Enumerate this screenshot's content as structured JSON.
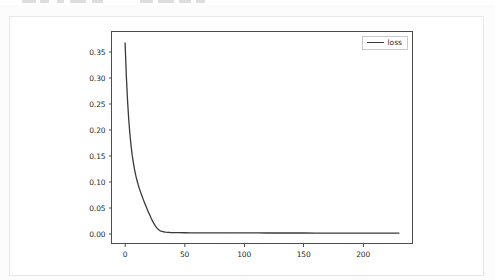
{
  "toolbar": {
    "visible_sliver": true,
    "items": [
      {
        "name": "toolbar-chip-1",
        "x": 22,
        "w": 14
      },
      {
        "name": "toolbar-chip-2",
        "x": 40,
        "w": 9
      },
      {
        "name": "toolbar-chip-3",
        "x": 57,
        "w": 7
      },
      {
        "name": "toolbar-chip-4",
        "x": 70,
        "w": 16
      },
      {
        "name": "toolbar-chip-5",
        "x": 92,
        "w": 11
      },
      {
        "name": "toolbar-chip-6",
        "x": 140,
        "w": 13
      },
      {
        "name": "toolbar-chip-7",
        "x": 158,
        "w": 16
      },
      {
        "name": "toolbar-chip-8",
        "x": 179,
        "w": 12
      },
      {
        "name": "toolbar-chip-9",
        "x": 196,
        "w": 9
      }
    ]
  },
  "card": {
    "background": "#ffffff",
    "border_color": "#e9e9ea"
  },
  "chart_data": {
    "type": "line",
    "title": "",
    "xlabel": "",
    "ylabel": "",
    "xlim": [
      -11,
      241
    ],
    "ylim": [
      -0.018,
      0.389
    ],
    "grid": false,
    "legend": {
      "position": "upper right",
      "entries": [
        "loss"
      ]
    },
    "xticks": [
      0,
      50,
      100,
      150,
      200
    ],
    "xticklabels": [
      "0",
      "50",
      "100",
      "150",
      "200"
    ],
    "yticks": [
      0.0,
      0.05,
      0.1,
      0.15,
      0.2,
      0.25,
      0.3,
      0.35
    ],
    "yticklabels": [
      "0.00",
      "0.05",
      "0.10",
      "0.15",
      "0.20",
      "0.25",
      "0.30",
      "0.35"
    ],
    "line_color": "#3a3a3a",
    "line_width": 1.3,
    "series": [
      {
        "name": "loss",
        "color": "#3a3a3a",
        "x": [
          0,
          1,
          2,
          3,
          4,
          5,
          6,
          7,
          8,
          9,
          10,
          11,
          12,
          13,
          14,
          15,
          16,
          17,
          18,
          19,
          20,
          21,
          22,
          23,
          24,
          25,
          26,
          27,
          28,
          29,
          30,
          32,
          34,
          36,
          38,
          40,
          45,
          50,
          55,
          60,
          70,
          80,
          90,
          100,
          110,
          120,
          130,
          140,
          150,
          160,
          170,
          180,
          190,
          200,
          210,
          220,
          230
        ],
        "y": [
          0.368,
          0.306,
          0.259,
          0.222,
          0.193,
          0.17,
          0.151,
          0.136,
          0.123,
          0.112,
          0.1025,
          0.0943,
          0.0869,
          0.0801,
          0.0737,
          0.0676,
          0.0617,
          0.056,
          0.0504,
          0.0449,
          0.0396,
          0.0344,
          0.0294,
          0.0247,
          0.0203,
          0.0164,
          0.013,
          0.0102,
          0.0079,
          0.0062,
          0.005,
          0.0037,
          0.003,
          0.0026,
          0.0023,
          0.0021,
          0.0019,
          0.0018,
          0.0017,
          0.0016,
          0.00155,
          0.0015,
          0.00145,
          0.0014,
          0.00137,
          0.00133,
          0.0013,
          0.00127,
          0.00124,
          0.00121,
          0.00118,
          0.00115,
          0.00112,
          0.0011,
          0.00107,
          0.00105,
          0.00102
        ]
      }
    ]
  }
}
